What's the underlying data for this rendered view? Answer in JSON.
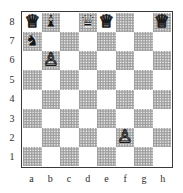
{
  "diagram": {
    "kind": "chess-board-diagram",
    "orientation": "white-bottom",
    "rank_labels": [
      "8",
      "7",
      "6",
      "5",
      "4",
      "3",
      "2",
      "1"
    ],
    "file_labels": [
      "a",
      "b",
      "c",
      "d",
      "e",
      "f",
      "g",
      "h"
    ],
    "colors": {
      "light_square": "#ffffff",
      "dark_square": "#9a9a9a",
      "border": "#3a3a3a",
      "label_text": "#2b2b2b",
      "white_piece_fill": "#ffffff",
      "white_piece_outline": "#1a1a1a",
      "black_piece_fill": "#141414"
    },
    "squares": [
      {
        "square": "a8",
        "shade": "light",
        "piece": "white-queen",
        "glyph": "♕",
        "color": "white"
      },
      {
        "square": "b8",
        "shade": "dark",
        "piece": "black-bishop",
        "glyph": "♝",
        "color": "black"
      },
      {
        "square": "c8",
        "shade": "light",
        "piece": null,
        "glyph": "",
        "color": null
      },
      {
        "square": "d8",
        "shade": "dark",
        "piece": "black-queen",
        "glyph": "♛",
        "color": "black"
      },
      {
        "square": "e8",
        "shade": "light",
        "piece": "white-queen",
        "glyph": "♕",
        "color": "white"
      },
      {
        "square": "f8",
        "shade": "dark",
        "piece": null,
        "glyph": "",
        "color": null
      },
      {
        "square": "g8",
        "shade": "light",
        "piece": null,
        "glyph": "",
        "color": null
      },
      {
        "square": "h8",
        "shade": "dark",
        "piece": "white-queen",
        "glyph": "♕",
        "color": "white"
      },
      {
        "square": "a7",
        "shade": "dark",
        "piece": "black-knight",
        "glyph": "♞",
        "color": "black"
      },
      {
        "square": "b7",
        "shade": "light",
        "piece": null,
        "glyph": "",
        "color": null
      },
      {
        "square": "c7",
        "shade": "dark",
        "piece": null,
        "glyph": "",
        "color": null
      },
      {
        "square": "d7",
        "shade": "light",
        "piece": null,
        "glyph": "",
        "color": null
      },
      {
        "square": "e7",
        "shade": "dark",
        "piece": null,
        "glyph": "",
        "color": null
      },
      {
        "square": "f7",
        "shade": "light",
        "piece": null,
        "glyph": "",
        "color": null
      },
      {
        "square": "g7",
        "shade": "dark",
        "piece": null,
        "glyph": "",
        "color": null
      },
      {
        "square": "h7",
        "shade": "light",
        "piece": null,
        "glyph": "",
        "color": null
      },
      {
        "square": "a6",
        "shade": "light",
        "piece": null,
        "glyph": "",
        "color": null
      },
      {
        "square": "b6",
        "shade": "dark",
        "piece": "white-pawn",
        "glyph": "♙",
        "color": "white"
      },
      {
        "square": "c6",
        "shade": "light",
        "piece": null,
        "glyph": "",
        "color": null
      },
      {
        "square": "d6",
        "shade": "dark",
        "piece": null,
        "glyph": "",
        "color": null
      },
      {
        "square": "e6",
        "shade": "light",
        "piece": null,
        "glyph": "",
        "color": null
      },
      {
        "square": "f6",
        "shade": "dark",
        "piece": null,
        "glyph": "",
        "color": null
      },
      {
        "square": "g6",
        "shade": "light",
        "piece": null,
        "glyph": "",
        "color": null
      },
      {
        "square": "h6",
        "shade": "dark",
        "piece": null,
        "glyph": "",
        "color": null
      },
      {
        "square": "a5",
        "shade": "dark",
        "piece": null,
        "glyph": "",
        "color": null
      },
      {
        "square": "b5",
        "shade": "light",
        "piece": null,
        "glyph": "",
        "color": null
      },
      {
        "square": "c5",
        "shade": "dark",
        "piece": null,
        "glyph": "",
        "color": null
      },
      {
        "square": "d5",
        "shade": "light",
        "piece": null,
        "glyph": "",
        "color": null
      },
      {
        "square": "e5",
        "shade": "dark",
        "piece": null,
        "glyph": "",
        "color": null
      },
      {
        "square": "f5",
        "shade": "light",
        "piece": null,
        "glyph": "",
        "color": null
      },
      {
        "square": "g5",
        "shade": "dark",
        "piece": null,
        "glyph": "",
        "color": null
      },
      {
        "square": "h5",
        "shade": "light",
        "piece": null,
        "glyph": "",
        "color": null
      },
      {
        "square": "a4",
        "shade": "light",
        "piece": null,
        "glyph": "",
        "color": null
      },
      {
        "square": "b4",
        "shade": "dark",
        "piece": null,
        "glyph": "",
        "color": null
      },
      {
        "square": "c4",
        "shade": "light",
        "piece": null,
        "glyph": "",
        "color": null
      },
      {
        "square": "d4",
        "shade": "dark",
        "piece": null,
        "glyph": "",
        "color": null
      },
      {
        "square": "e4",
        "shade": "light",
        "piece": null,
        "glyph": "",
        "color": null
      },
      {
        "square": "f4",
        "shade": "dark",
        "piece": null,
        "glyph": "",
        "color": null
      },
      {
        "square": "g4",
        "shade": "light",
        "piece": null,
        "glyph": "",
        "color": null
      },
      {
        "square": "h4",
        "shade": "dark",
        "piece": null,
        "glyph": "",
        "color": null
      },
      {
        "square": "a3",
        "shade": "dark",
        "piece": null,
        "glyph": "",
        "color": null
      },
      {
        "square": "b3",
        "shade": "light",
        "piece": null,
        "glyph": "",
        "color": null
      },
      {
        "square": "c3",
        "shade": "dark",
        "piece": null,
        "glyph": "",
        "color": null
      },
      {
        "square": "d3",
        "shade": "light",
        "piece": null,
        "glyph": "",
        "color": null
      },
      {
        "square": "e3",
        "shade": "dark",
        "piece": null,
        "glyph": "",
        "color": null
      },
      {
        "square": "f3",
        "shade": "light",
        "piece": null,
        "glyph": "",
        "color": null
      },
      {
        "square": "g3",
        "shade": "dark",
        "piece": null,
        "glyph": "",
        "color": null
      },
      {
        "square": "h3",
        "shade": "light",
        "piece": null,
        "glyph": "",
        "color": null
      },
      {
        "square": "a2",
        "shade": "light",
        "piece": null,
        "glyph": "",
        "color": null
      },
      {
        "square": "b2",
        "shade": "dark",
        "piece": null,
        "glyph": "",
        "color": null
      },
      {
        "square": "c2",
        "shade": "light",
        "piece": null,
        "glyph": "",
        "color": null
      },
      {
        "square": "d2",
        "shade": "dark",
        "piece": null,
        "glyph": "",
        "color": null
      },
      {
        "square": "e2",
        "shade": "light",
        "piece": null,
        "glyph": "",
        "color": null
      },
      {
        "square": "f2",
        "shade": "dark",
        "piece": "white-pawn",
        "glyph": "♙",
        "color": "white"
      },
      {
        "square": "g2",
        "shade": "light",
        "piece": null,
        "glyph": "",
        "color": null
      },
      {
        "square": "h2",
        "shade": "dark",
        "piece": null,
        "glyph": "",
        "color": null
      },
      {
        "square": "a1",
        "shade": "dark",
        "piece": null,
        "glyph": "",
        "color": null
      },
      {
        "square": "b1",
        "shade": "light",
        "piece": null,
        "glyph": "",
        "color": null
      },
      {
        "square": "c1",
        "shade": "dark",
        "piece": null,
        "glyph": "",
        "color": null
      },
      {
        "square": "d1",
        "shade": "light",
        "piece": null,
        "glyph": "",
        "color": null
      },
      {
        "square": "e1",
        "shade": "dark",
        "piece": null,
        "glyph": "",
        "color": null
      },
      {
        "square": "f1",
        "shade": "light",
        "piece": null,
        "glyph": "",
        "color": null
      },
      {
        "square": "g1",
        "shade": "dark",
        "piece": null,
        "glyph": "",
        "color": null
      },
      {
        "square": "h1",
        "shade": "light",
        "piece": null,
        "glyph": "",
        "color": null
      }
    ]
  }
}
